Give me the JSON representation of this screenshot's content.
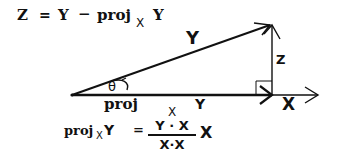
{
  "formula_top": {
    "lhs": "Z",
    "eq": "=",
    "y": "Y",
    "minus": "−",
    "proj": "proj",
    "sub": "X",
    "y2": "Y"
  },
  "labels": {
    "vector_y": "Y",
    "vector_z": "Z",
    "vector_x": "X",
    "angle": "θ",
    "proj_label": "proj",
    "proj_sub": "X",
    "proj_y": "Y"
  },
  "formula_bottom": {
    "proj": "proj",
    "sub": "X",
    "y": "Y",
    "eq": "=",
    "numerator": "Y · X",
    "denominator": "X·X",
    "times": "X"
  },
  "colors": {
    "ink": "#111111",
    "background": "#ffffff"
  }
}
